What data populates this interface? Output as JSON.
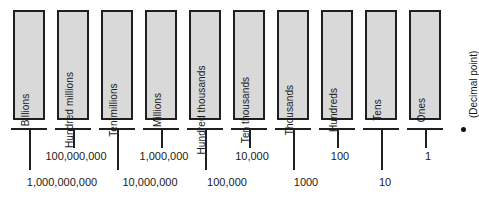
{
  "diagram": {
    "columns": [
      {
        "label": "Billions"
      },
      {
        "label": "Hundred millions"
      },
      {
        "label": "Ten millions"
      },
      {
        "label": "Millions"
      },
      {
        "label": "Hundred thousands"
      },
      {
        "label": "Ten thousands"
      },
      {
        "label": "Thousands"
      },
      {
        "label": "Hundreds"
      },
      {
        "label": "Tens"
      },
      {
        "label": "Ones"
      }
    ],
    "decimal_point_label": "(Decimal point)",
    "decimal_point_marker": "•",
    "upper_values": [
      {
        "text": "100,000,000"
      },
      {
        "text": "1,000,000"
      },
      {
        "text": "10,000"
      },
      {
        "text": "100"
      },
      {
        "text": "1"
      }
    ],
    "lower_values": [
      {
        "text": "1,000,000,000"
      },
      {
        "text": "10,000,000"
      },
      {
        "text": "100,000"
      },
      {
        "text": "1000"
      },
      {
        "text": "10"
      }
    ],
    "colors": {
      "box_fill": "#d9d9d9",
      "box_border": "#1f1f1f",
      "text": "#1a1a1a",
      "background": "#ffffff"
    }
  }
}
